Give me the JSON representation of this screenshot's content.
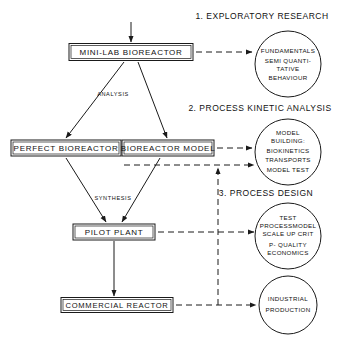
{
  "figure": {
    "type": "flow-diagram",
    "title": "",
    "background": "#ffffff",
    "line_color": "#1a1a1a"
  },
  "boxes": [
    {
      "id": "mini-lab-bioreactor",
      "label": "MINI-LAB BIOREACTOR",
      "cx": 131,
      "cy": 52,
      "w": 124,
      "h": 17
    },
    {
      "id": "perfect-bioreactor",
      "label": "PERFECT BIOREACTOR",
      "cx": 66,
      "cy": 148,
      "w": 110,
      "h": 16
    },
    {
      "id": "bioreactor-model",
      "label": "BIOREACTOR MODEL",
      "cx": 168,
      "cy": 148,
      "w": 92,
      "h": 16
    },
    {
      "id": "pilot-plant",
      "label": "PILOT PLANT",
      "cx": 114,
      "cy": 232,
      "w": 82,
      "h": 16
    },
    {
      "id": "commercial-reactor",
      "label": "COMMERCIAL REACTOR",
      "cx": 117,
      "cy": 305,
      "w": 112,
      "h": 15
    }
  ],
  "headings": [
    {
      "id": "exploratory-research",
      "label": "1. EXPLORATORY RESEARCH",
      "cx": 262,
      "cy": 16
    },
    {
      "id": "process-kinetic-analysis",
      "label": "2. PROCESS KINETIC ANALYSIS",
      "cx": 260,
      "cy": 108
    },
    {
      "id": "process-design",
      "label": "3. PROCESS DESIGN",
      "cx": 266,
      "cy": 193
    }
  ],
  "circles": [
    {
      "id": "fundamentals",
      "cx": 288,
      "cy": 64,
      "r": 33,
      "lines": [
        "FUNDAMENTALS",
        "SEMI QUANTI-",
        "TATIVE",
        "BEHAVIOUR"
      ]
    },
    {
      "id": "model-building",
      "cx": 288,
      "cy": 152,
      "r": 33,
      "lines": [
        "MODEL",
        "BUILDING:",
        "BIOKINETICS",
        "TRANSPORTS",
        "MODEL TEST"
      ]
    },
    {
      "id": "process-design-tests",
      "cx": 288,
      "cy": 236,
      "r": 33,
      "lines": [
        "TEST",
        "PROCESSMODEL",
        "SCALE UP CRIT",
        "P- QUALITY",
        "ECONOMICS"
      ]
    },
    {
      "id": "industrial-production",
      "cx": 288,
      "cy": 305,
      "r": 29,
      "lines": [
        "INDUSTRIAL",
        "PRODUCTION"
      ]
    }
  ],
  "edge_labels": [
    {
      "id": "analysis",
      "label": "ANALYSIS",
      "cx": 113,
      "cy": 94
    },
    {
      "id": "synthesis",
      "label": "SYNTHESIS",
      "cx": 113,
      "cy": 198
    }
  ],
  "solid_connectors": [
    {
      "id": "input-to-mini-lab",
      "from": "input",
      "to": "mini-lab-bioreactor"
    },
    {
      "id": "mini-lab-to-perfect-bioreactor",
      "from": "mini-lab-bioreactor",
      "to": "perfect-bioreactor"
    },
    {
      "id": "mini-lab-to-bioreactor-model",
      "from": "mini-lab-bioreactor",
      "to": "bioreactor-model"
    },
    {
      "id": "perfect-bioreactor-to-pilot-plant",
      "from": "perfect-bioreactor",
      "to": "pilot-plant"
    },
    {
      "id": "bioreactor-model-to-pilot-plant",
      "from": "bioreactor-model",
      "to": "pilot-plant"
    },
    {
      "id": "pilot-plant-to-commercial-reactor",
      "from": "pilot-plant",
      "to": "commercial-reactor"
    }
  ],
  "dashed_connectors": [
    {
      "id": "mini-lab-to-fundamentals",
      "from": "mini-lab-bioreactor",
      "to": "fundamentals"
    },
    {
      "id": "bioreactor-model-to-model-building",
      "from": "bioreactor-model",
      "to": "model-building"
    },
    {
      "id": "perfect-bioreactor-to-model-test",
      "from": "perfect-bioreactor",
      "to": "model-building"
    },
    {
      "id": "pilot-plant-to-process-design-tests",
      "from": "pilot-plant",
      "to": "process-design-tests"
    },
    {
      "id": "commercial-reactor-to-industrial-production",
      "from": "commercial-reactor",
      "to": "industrial-production"
    },
    {
      "id": "vertical-feedback-line",
      "from": "commercial-reactor-row",
      "to": "model-test-row"
    }
  ]
}
